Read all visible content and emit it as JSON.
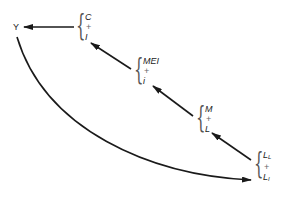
{
  "diagram": {
    "output_node": {
      "label": "Y"
    },
    "groups": [
      {
        "id": "c-i",
        "top": "C",
        "op": "+",
        "bottom": "I"
      },
      {
        "id": "mei-i",
        "top": "MEI",
        "op": "+",
        "bottom": "i"
      },
      {
        "id": "m-l",
        "top": "M",
        "op": "+",
        "bottom": "L"
      },
      {
        "id": "ll-li",
        "top": "L",
        "top_sub": "L",
        "op": "+",
        "bottom": "L",
        "bottom_sub": "I"
      }
    ],
    "edges": [
      {
        "from": "c-i",
        "to": "Y"
      },
      {
        "from": "mei-i",
        "to": "c-i"
      },
      {
        "from": "m-l",
        "to": "mei-i"
      },
      {
        "from": "ll-li",
        "to": "m-l"
      },
      {
        "from": "Y",
        "to": "ll-li",
        "style": "curved"
      }
    ],
    "colors": {
      "stroke": "#1a1a1a",
      "text": "#222222",
      "background": "#ffffff"
    }
  }
}
